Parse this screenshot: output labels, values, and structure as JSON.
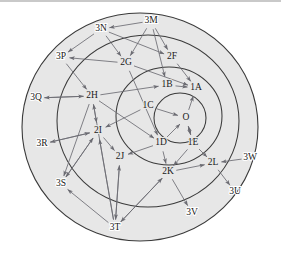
{
  "figure": {
    "kind": "concentric-network-diagram",
    "background_color": "#ffffff",
    "disc_fill_color": "#e7e7e7",
    "ring_stroke_color": "#3a3a3a",
    "edge_color": "#6b6b72",
    "label_color": "#1a1a1a",
    "top_rule_color": "#c9c9c9",
    "ring_count": 4
  },
  "rings": [
    {
      "id": "ring-core",
      "index": 0,
      "label": "innermost-circle"
    },
    {
      "id": "ring-inner",
      "index": 1,
      "label": "inner-ring"
    },
    {
      "id": "ring-middle",
      "index": 2,
      "label": "middle-ring"
    },
    {
      "id": "ring-outer",
      "index": 3,
      "label": "outer-ring"
    }
  ],
  "nodes": [
    {
      "id": "O",
      "text": "O",
      "ring": "ring-core",
      "x": 186,
      "y": 118
    },
    {
      "id": "1A",
      "text": "1A",
      "ring": "ring-inner",
      "x": 196,
      "y": 88
    },
    {
      "id": "1B",
      "text": "1B",
      "ring": "ring-inner",
      "x": 167,
      "y": 85
    },
    {
      "id": "1C",
      "text": "1C",
      "ring": "ring-inner",
      "x": 148,
      "y": 106
    },
    {
      "id": "1D",
      "text": "1D",
      "ring": "ring-inner",
      "x": 161,
      "y": 143
    },
    {
      "id": "1E",
      "text": "1E",
      "ring": "ring-inner",
      "x": 193,
      "y": 143
    },
    {
      "id": "2F",
      "text": "2F",
      "ring": "ring-middle",
      "x": 172,
      "y": 57
    },
    {
      "id": "2G",
      "text": "2G",
      "ring": "ring-middle",
      "x": 126,
      "y": 63
    },
    {
      "id": "2H",
      "text": "2H",
      "ring": "ring-middle",
      "x": 92,
      "y": 96
    },
    {
      "id": "2I",
      "text": "2I",
      "ring": "ring-middle",
      "x": 98,
      "y": 131
    },
    {
      "id": "2J",
      "text": "2J",
      "ring": "ring-middle",
      "x": 120,
      "y": 157
    },
    {
      "id": "2K",
      "text": "2K",
      "ring": "ring-middle",
      "x": 168,
      "y": 172
    },
    {
      "id": "2L",
      "text": "2L",
      "ring": "ring-middle",
      "x": 213,
      "y": 163
    },
    {
      "id": "3M",
      "text": "3M",
      "ring": "ring-outer",
      "x": 151,
      "y": 21
    },
    {
      "id": "3N",
      "text": "3N",
      "ring": "ring-outer",
      "x": 101,
      "y": 29
    },
    {
      "id": "3P",
      "text": "3P",
      "ring": "ring-outer",
      "x": 61,
      "y": 57
    },
    {
      "id": "3Q",
      "text": "3Q",
      "ring": "ring-outer",
      "x": 36,
      "y": 98
    },
    {
      "id": "3R",
      "text": "3R",
      "ring": "ring-outer",
      "x": 42,
      "y": 144
    },
    {
      "id": "3S",
      "text": "3S",
      "ring": "ring-outer",
      "x": 61,
      "y": 184
    },
    {
      "id": "3T",
      "text": "3T",
      "ring": "ring-outer",
      "x": 115,
      "y": 228
    },
    {
      "id": "3U",
      "text": "3U",
      "ring": "ring-outer",
      "x": 235,
      "y": 192
    },
    {
      "id": "3V",
      "text": "3V",
      "ring": "ring-outer",
      "x": 192,
      "y": 213
    },
    {
      "id": "3W",
      "text": "3W",
      "ring": "ring-outer",
      "x": 250,
      "y": 158
    }
  ],
  "edges": [
    {
      "from": "1C",
      "to": "O"
    },
    {
      "from": "1D",
      "to": "O"
    },
    {
      "from": "1E",
      "to": "O"
    },
    {
      "from": "O",
      "to": "1A"
    },
    {
      "from": "O",
      "to": "1E"
    },
    {
      "from": "1B",
      "to": "1A"
    },
    {
      "from": "2F",
      "to": "1A"
    },
    {
      "from": "2G",
      "to": "1A"
    },
    {
      "from": "2H",
      "to": "1B"
    },
    {
      "from": "3M",
      "to": "2F"
    },
    {
      "from": "3M",
      "to": "2G"
    },
    {
      "from": "3M",
      "to": "1B"
    },
    {
      "from": "3N",
      "to": "2F"
    },
    {
      "from": "3N",
      "to": "2G"
    },
    {
      "from": "2G",
      "to": "3P"
    },
    {
      "from": "3P",
      "to": "2H"
    },
    {
      "from": "2H",
      "to": "3Q"
    },
    {
      "from": "3Q",
      "to": "2H"
    },
    {
      "from": "2H",
      "to": "2I"
    },
    {
      "from": "2I",
      "to": "3R"
    },
    {
      "from": "3R",
      "to": "2I"
    },
    {
      "from": "2I",
      "to": "3S"
    },
    {
      "from": "3S",
      "to": "2I"
    },
    {
      "from": "2H",
      "to": "3S"
    },
    {
      "from": "2I",
      "to": "2J"
    },
    {
      "from": "2J",
      "to": "3T"
    },
    {
      "from": "3T",
      "to": "2J"
    },
    {
      "from": "3T",
      "to": "2I"
    },
    {
      "from": "3T",
      "to": "2H"
    },
    {
      "from": "3T",
      "to": "3S"
    },
    {
      "from": "3T",
      "to": "2K"
    },
    {
      "from": "2K",
      "to": "3T"
    },
    {
      "from": "2K",
      "to": "3V"
    },
    {
      "from": "1D",
      "to": "2K"
    },
    {
      "from": "1E",
      "to": "2K"
    },
    {
      "from": "1E",
      "to": "2L"
    },
    {
      "from": "2L",
      "to": "3U"
    },
    {
      "from": "3W",
      "to": "2L"
    },
    {
      "from": "2K",
      "to": "2L"
    },
    {
      "from": "1C",
      "to": "2I"
    },
    {
      "from": "2G",
      "to": "1D"
    },
    {
      "from": "2H",
      "to": "1D"
    },
    {
      "from": "1D",
      "to": "2J"
    },
    {
      "from": "3N",
      "to": "3P"
    },
    {
      "from": "3M",
      "to": "3N"
    }
  ]
}
